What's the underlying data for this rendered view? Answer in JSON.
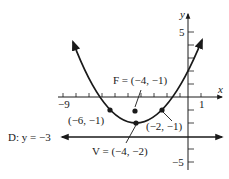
{
  "diagram": {
    "type": "parabola-graph",
    "equation_shape": "(x+4)^2 = 4(y+2)",
    "axes": {
      "x_label": "x",
      "y_label": "y",
      "x_tick_labels": {
        "left": "−9",
        "right": "1"
      },
      "y_tick_labels": {
        "top": "5",
        "bottom": "−5"
      },
      "x_range": [
        -9,
        1
      ],
      "y_range": [
        -5,
        5
      ]
    },
    "points": {
      "focus": {
        "label": "F = (−4, −1)",
        "x": -4,
        "y": -1
      },
      "vertex": {
        "label": "V = (−4, −2)",
        "x": -4,
        "y": -2
      },
      "left_point": {
        "label": "(−6, −1)",
        "x": -6,
        "y": -1
      },
      "right_point": {
        "label": "(−2, −1)",
        "x": -2,
        "y": -1
      }
    },
    "directrix": {
      "label": "D: y = −3",
      "y": -3
    },
    "colors": {
      "ink": "#1a1a1a",
      "background": "#ffffff"
    }
  }
}
